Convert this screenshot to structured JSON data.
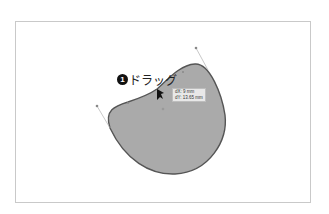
{
  "annotation": {
    "step_number": "1",
    "label": "ドラッグ"
  },
  "tooltip": {
    "dx": "dX: 9 mm",
    "dy": "dY: 13.65 mm"
  },
  "colors": {
    "shape_fill": "#aaaaaa",
    "shape_stroke": "#555555",
    "handle_line": "#b0b0b0"
  }
}
